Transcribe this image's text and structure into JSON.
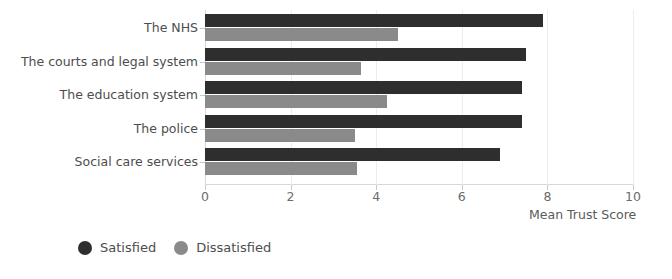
{
  "chart_data": {
    "type": "bar",
    "orientation": "horizontal",
    "title": "",
    "subtitle": "",
    "xlabel": "Mean Trust Score",
    "ylabel": "",
    "xlim": [
      0,
      10
    ],
    "xticks": [
      0,
      2,
      4,
      6,
      8,
      10
    ],
    "xtick_labels": [
      "0",
      "2",
      "4",
      "6",
      "8",
      "10"
    ],
    "grid": true,
    "grid_axis": "x",
    "legend_position": "bottom-left",
    "categories": [
      "The NHS",
      "The courts and legal system",
      "The education system",
      "The police",
      "Social care services"
    ],
    "series": [
      {
        "name": "Satisfied",
        "color": "#2e2e2e",
        "values": [
          7.9,
          7.5,
          7.4,
          7.4,
          6.9
        ]
      },
      {
        "name": "Dissatisfied",
        "color": "#8a8a8a",
        "values": [
          4.5,
          3.65,
          4.25,
          3.5,
          3.55
        ]
      }
    ]
  },
  "legend": {
    "items": [
      {
        "label": "Satisfied",
        "color": "#2e2e2e",
        "icon": "filled-circle-icon"
      },
      {
        "label": "Dissatisfied",
        "color": "#8a8a8a",
        "icon": "filled-circle-icon"
      }
    ]
  },
  "colors": {
    "satisfied": "#2e2e2e",
    "dissatisfied": "#8a8a8a",
    "gridline": "#ededed",
    "axis": "#d8d8d8",
    "text": "#4d4d4d",
    "background": "#ffffff"
  }
}
